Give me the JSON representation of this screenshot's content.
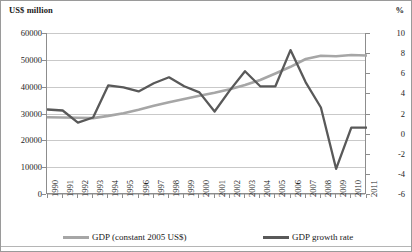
{
  "axis_captions": {
    "left_unit": "US$ million",
    "right_unit": "%"
  },
  "legend": {
    "items": [
      {
        "label": "GDP (constant 2005 US$)",
        "color": "#a6a6a6",
        "name": "legend-gdp-level"
      },
      {
        "label": "GDP growth rate",
        "color": "#595959",
        "name": "legend-gdp-growth"
      }
    ]
  },
  "chart_data": {
    "type": "line",
    "title": "",
    "subtitle": "",
    "xlabel": "",
    "ylabel": "US$ million",
    "y2label": "%",
    "grid": true,
    "legend_position": "bottom",
    "categories": [
      "1990",
      "1991",
      "1992",
      "1993",
      "1994",
      "1995",
      "1996",
      "1997",
      "1998",
      "1999",
      "2000",
      "2001",
      "2002",
      "2003",
      "2004",
      "2005",
      "2006",
      "2007",
      "2008",
      "2009",
      "2010",
      "2011"
    ],
    "left_axis": {
      "ticks": [
        "0",
        "10000",
        "20000",
        "30000",
        "40000",
        "50000",
        "60000"
      ],
      "tick_values": [
        0,
        10000,
        20000,
        30000,
        40000,
        50000,
        60000
      ],
      "ylim": [
        0,
        60000
      ]
    },
    "right_axis": {
      "ticks": [
        "-6",
        "-4",
        "-2",
        "0",
        "2",
        "4",
        "6",
        "8",
        "10"
      ],
      "tick_values": [
        -6,
        -4,
        -2,
        0,
        2,
        4,
        6,
        8,
        10
      ],
      "ylim": [
        -6,
        10
      ]
    },
    "series": [
      {
        "name": "GDP (constant 2005 US$)",
        "axis": "left",
        "color": "#a6a6a6",
        "unit": "US$ million",
        "values": [
          28600,
          28500,
          28400,
          28300,
          29100,
          30100,
          31400,
          32900,
          34200,
          35400,
          36600,
          37700,
          39000,
          40600,
          42500,
          44900,
          47400,
          50300,
          51500,
          51300,
          51800,
          51600
        ]
      },
      {
        "name": "GDP growth rate",
        "axis": "right",
        "color": "#595959",
        "unit": "%",
        "values": [
          2.4,
          2.3,
          1.1,
          1.6,
          4.8,
          4.6,
          4.2,
          5.0,
          5.6,
          4.7,
          4.1,
          2.2,
          4.3,
          6.2,
          4.7,
          4.7,
          8.3,
          5.1,
          2.6,
          -3.5,
          0.6,
          0.6
        ]
      }
    ]
  }
}
